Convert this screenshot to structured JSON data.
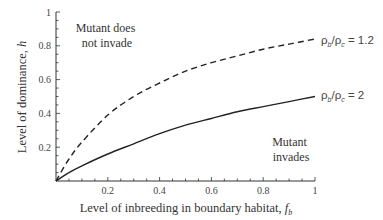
{
  "chart_data": {
    "type": "line",
    "title": "",
    "xlabel": "Level of inbreeding in boundary habitat, f_b",
    "xlabel_main": "Level of inbreeding in boundary habitat, ",
    "xlabel_var": "f",
    "xlabel_sub": "b",
    "ylabel": "Level of dominance, h",
    "ylabel_main": "Level of dominance, ",
    "ylabel_var": "h",
    "xlim": [
      0,
      1
    ],
    "ylim": [
      0,
      1
    ],
    "grid": false,
    "x_ticks": [
      {
        "value": 0.2,
        "label": "0.2"
      },
      {
        "value": 0.4,
        "label": "0.4"
      },
      {
        "value": 0.6,
        "label": "0.6"
      },
      {
        "value": 0.8,
        "label": "0.8"
      },
      {
        "value": 1.0,
        "label": "1"
      }
    ],
    "y_ticks": [
      {
        "value": 0.2,
        "label": "0.2"
      },
      {
        "value": 0.4,
        "label": "0.4"
      },
      {
        "value": 0.6,
        "label": "0.6"
      },
      {
        "value": 0.8,
        "label": "0.8"
      },
      {
        "value": 1.0,
        "label": "1"
      }
    ],
    "x": [
      0,
      0.05,
      0.1,
      0.2,
      0.3,
      0.4,
      0.5,
      0.6,
      0.7,
      0.8,
      0.9,
      1.0
    ],
    "series": [
      {
        "name": "ρb/ρc = 1.2",
        "style": "dashed",
        "values": [
          0,
          0.13,
          0.23,
          0.39,
          0.5,
          0.58,
          0.65,
          0.7,
          0.74,
          0.78,
          0.81,
          0.84
        ]
      },
      {
        "name": "ρb/ρc = 2",
        "style": "solid",
        "values": [
          0,
          0.05,
          0.09,
          0.16,
          0.22,
          0.28,
          0.33,
          0.37,
          0.41,
          0.44,
          0.47,
          0.5
        ]
      }
    ],
    "legend_labels": [
      {
        "rho": "ρ",
        "sub1": "b",
        "slash": "/",
        "sub2": "c",
        "value": " = 1.2"
      },
      {
        "rho": "ρ",
        "sub1": "b",
        "slash": "/",
        "sub2": "c",
        "value": " = 2"
      }
    ],
    "annotations": [
      {
        "lines": [
          "Mutant does",
          "not invade"
        ]
      },
      {
        "lines": [
          "Mutant",
          "invades"
        ]
      }
    ]
  }
}
